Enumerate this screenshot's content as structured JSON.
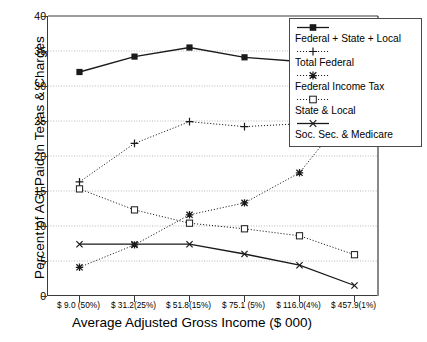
{
  "chart_data": {
    "type": "line",
    "title": "",
    "xlabel": "Average Adjusted Gross Income ($ 000)",
    "ylabel": "Percent of AGI Paid in Texas & Charges",
    "categories": [
      "$ 9.0 (50%)",
      "$ 31.2(25%)",
      "$ 51.8(15%)",
      "$ 75.1 (5%)",
      "$ 116.0(4%)",
      "$ 457.9(1%)"
    ],
    "ylim": [
      0,
      40
    ],
    "yticks": [
      "0",
      "5",
      "10",
      "15",
      "20",
      "25",
      "30",
      "35",
      "40"
    ],
    "grid": true,
    "legend_position": "top-right",
    "series": [
      {
        "name": "Federal + State + Local",
        "marker": "filled-square",
        "line": "solid",
        "values": [
          32.0,
          34.2,
          35.5,
          34.1,
          33.5,
          35.2
        ]
      },
      {
        "name": "Total Federal",
        "marker": "plus",
        "line": "dotted",
        "values": [
          16.3,
          21.8,
          24.9,
          24.2,
          24.6,
          29.3
        ]
      },
      {
        "name": "Federal Income Tax",
        "marker": "asterisk",
        "line": "dotted",
        "values": [
          4.1,
          7.3,
          11.6,
          13.3,
          17.6,
          27.4
        ]
      },
      {
        "name": "State & Local",
        "marker": "open-square",
        "line": "dotted",
        "values": [
          15.3,
          12.3,
          10.4,
          9.6,
          8.6,
          5.9
        ]
      },
      {
        "name": "Soc. Sec. & Medicare",
        "marker": "cross",
        "line": "solid",
        "values": [
          7.4,
          7.4,
          7.4,
          6.0,
          4.4,
          1.5
        ]
      }
    ]
  },
  "legend": {
    "items": [
      {
        "label": "Federal + State + Local"
      },
      {
        "label": "Total Federal"
      },
      {
        "label": "Federal Income Tax"
      },
      {
        "label": "State & Local"
      },
      {
        "label": "Soc. Sec. & Medicare"
      }
    ]
  },
  "colors": {
    "axis": "#3a3a3a",
    "grid": "#9a9a9a",
    "series": "#1a1a1a"
  }
}
